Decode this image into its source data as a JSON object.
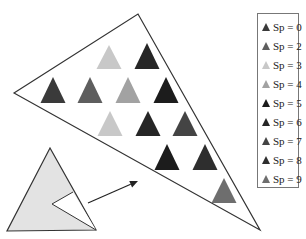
{
  "diagram": {
    "type": "triangle-subdivision-illustration",
    "outer_triangle": {
      "points": [
        [
          14,
          93
        ],
        [
          138,
          14
        ],
        [
          260,
          230
        ]
      ],
      "stroke": "#333333"
    },
    "small_triangle": {
      "points": [
        [
          50,
          148
        ],
        [
          7,
          231
        ],
        [
          96,
          230
        ]
      ],
      "fill": "#e3e3e3",
      "stroke": "#333333",
      "notch": [
        [
          73,
          192
        ],
        [
          52,
          204
        ],
        [
          96,
          230
        ]
      ]
    },
    "arrow": {
      "from": [
        88,
        203
      ],
      "to": [
        138,
        181
      ],
      "color": "#222222"
    },
    "markers": [
      {
        "row": 1,
        "cx": 109,
        "apex": 45,
        "base": 69,
        "sp": 3
      },
      {
        "row": 1,
        "cx": 147,
        "apex": 43,
        "base": 69,
        "sp": 6
      },
      {
        "row": 2,
        "cx": 53,
        "apex": 77,
        "base": 103,
        "sp": 0
      },
      {
        "row": 2,
        "cx": 90,
        "apex": 77,
        "base": 103,
        "sp": 2
      },
      {
        "row": 2,
        "cx": 128,
        "apex": 77,
        "base": 103,
        "sp": 4
      },
      {
        "row": 2,
        "cx": 166,
        "apex": 77,
        "base": 103,
        "sp": 5
      },
      {
        "row": 3,
        "cx": 110,
        "apex": 111,
        "base": 136,
        "sp": 3
      },
      {
        "row": 3,
        "cx": 148,
        "apex": 111,
        "base": 136,
        "sp": 6
      },
      {
        "row": 3,
        "cx": 185,
        "apex": 111,
        "base": 136,
        "sp": 7
      },
      {
        "row": 4,
        "cx": 167,
        "apex": 144,
        "base": 170,
        "sp": 5
      },
      {
        "row": 4,
        "cx": 205,
        "apex": 144,
        "base": 170,
        "sp": 8
      },
      {
        "row": 5,
        "cx": 224,
        "apex": 178,
        "base": 203,
        "sp": 9
      }
    ]
  },
  "legend": {
    "items": [
      {
        "label": "Sp = 0",
        "color": "#3a3a3a"
      },
      {
        "label": "Sp = 2",
        "color": "#5e5e5e"
      },
      {
        "label": "Sp = 3",
        "color": "#c8c8c8"
      },
      {
        "label": "Sp = 4",
        "color": "#a2a2a2"
      },
      {
        "label": "Sp = 5",
        "color": "#1c1c1c"
      },
      {
        "label": "Sp = 6",
        "color": "#262626"
      },
      {
        "label": "Sp = 7",
        "color": "#444444"
      },
      {
        "label": "Sp = 8",
        "color": "#2e2e2e"
      },
      {
        "label": "Sp = 9",
        "color": "#6e6e6e"
      }
    ]
  }
}
